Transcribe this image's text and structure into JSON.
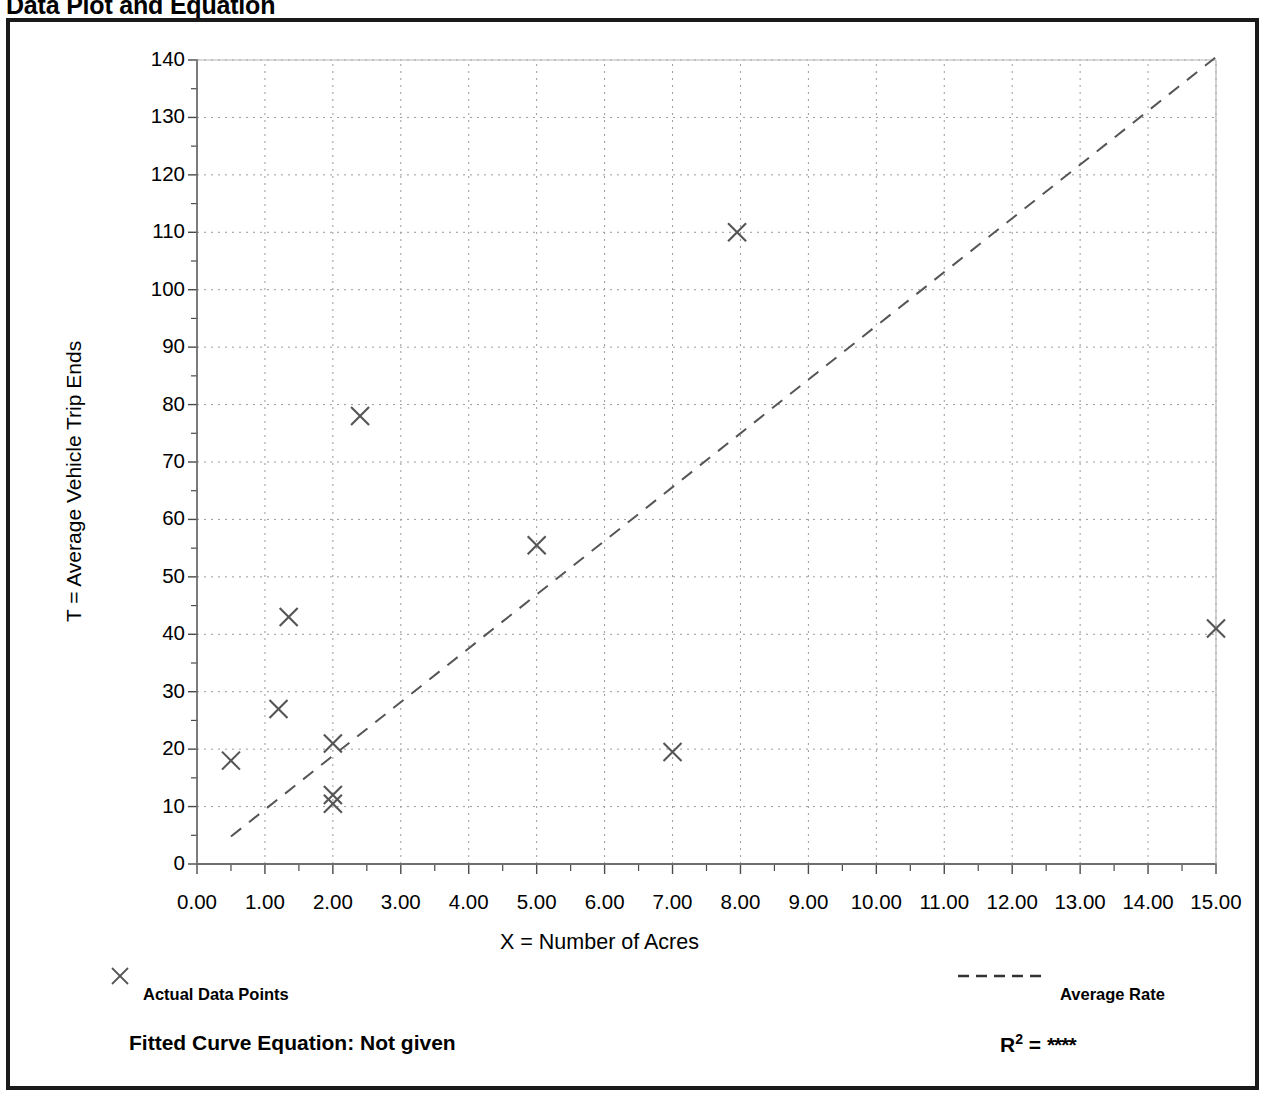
{
  "page": {
    "title": "Data Plot and Equation"
  },
  "axes": {
    "y_title": "T = Average Vehicle Trip Ends",
    "x_title": "X = Number of Acres"
  },
  "legend": {
    "points_marker": "×",
    "points_label": "Actual Data Points",
    "line_label": "Average Rate"
  },
  "footer": {
    "equation_label": "Fitted Curve Equation:  Not given",
    "r2_label": "R",
    "r2_exponent": "2",
    "r2_equals": " = ",
    "r2_value": "****"
  },
  "chart_data": {
    "type": "scatter",
    "title": "Data Plot and Equation",
    "xlabel": "X = Number of Acres",
    "ylabel": "T = Average Vehicle Trip Ends",
    "xlim": [
      0,
      15
    ],
    "ylim": [
      0,
      140
    ],
    "xticks": [
      0,
      1,
      2,
      3,
      4,
      5,
      6,
      7,
      8,
      9,
      10,
      11,
      12,
      13,
      14,
      15
    ],
    "xtick_labels": [
      "0.00",
      "1.00",
      "2.00",
      "3.00",
      "4.00",
      "5.00",
      "6.00",
      "7.00",
      "8.00",
      "9.00",
      "10.00",
      "11.00",
      "12.00",
      "13.00",
      "14.00",
      "15.00"
    ],
    "yticks": [
      0,
      10,
      20,
      30,
      40,
      50,
      60,
      70,
      80,
      90,
      100,
      110,
      120,
      130,
      140
    ],
    "ytick_labels": [
      "0",
      "10",
      "20",
      "30",
      "40",
      "50",
      "60",
      "70",
      "80",
      "90",
      "100",
      "110",
      "120",
      "130",
      "140"
    ],
    "x_minor_tick_interval": 0.5,
    "y_minor_tick_interval": 5,
    "grid": true,
    "grid_style": "dotted",
    "legend_position": "below-axes",
    "series": [
      {
        "name": "Actual Data Points",
        "type": "scatter",
        "marker": "x",
        "color": "#555555",
        "points": [
          {
            "x": 0.5,
            "y": 18.0
          },
          {
            "x": 1.2,
            "y": 27.0
          },
          {
            "x": 1.35,
            "y": 43.0
          },
          {
            "x": 2.0,
            "y": 21.0
          },
          {
            "x": 2.0,
            "y": 12.0
          },
          {
            "x": 2.0,
            "y": 10.5
          },
          {
            "x": 2.4,
            "y": 78.0
          },
          {
            "x": 5.0,
            "y": 55.5
          },
          {
            "x": 7.0,
            "y": 19.5
          },
          {
            "x": 7.95,
            "y": 110.0
          },
          {
            "x": 15.0,
            "y": 41.0
          }
        ]
      },
      {
        "name": "Average Rate",
        "type": "line",
        "style": "dashed",
        "color": "#555555",
        "x": [
          0.5,
          15.0
        ],
        "y": [
          4.8,
          140.5
        ]
      }
    ]
  }
}
